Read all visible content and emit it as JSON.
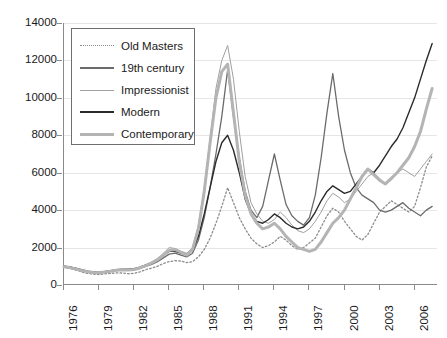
{
  "chart_data": {
    "type": "line",
    "title": "",
    "xlabel": "",
    "ylabel": "",
    "ylim": [
      0,
      14000
    ],
    "xlim": [
      1976,
      2008
    ],
    "grid": true,
    "legend_position": "top-left",
    "ytick_labels": [
      "14000",
      "12000",
      "10000",
      "8000",
      "6000",
      "4000",
      "2000",
      "0"
    ],
    "ytick_values": [
      14000,
      12000,
      10000,
      8000,
      6000,
      4000,
      2000,
      0
    ],
    "xtick_labels": [
      "1976",
      "1979",
      "1982",
      "1985",
      "1988",
      "1991",
      "1994",
      "1997",
      "2000",
      "2003",
      "2006"
    ],
    "xtick_values": [
      1976,
      1979,
      1982,
      1985,
      1988,
      1991,
      1994,
      1997,
      2000,
      2003,
      2006
    ],
    "x": [
      1976,
      1976.5,
      1977,
      1977.5,
      1978,
      1978.5,
      1979,
      1979.5,
      1980,
      1980.5,
      1981,
      1981.5,
      1982,
      1982.5,
      1983,
      1983.5,
      1984,
      1984.5,
      1985,
      1985.5,
      1986,
      1986.5,
      1987,
      1987.5,
      1988,
      1988.5,
      1989,
      1989.5,
      1990,
      1990.5,
      1991,
      1991.5,
      1992,
      1992.5,
      1993,
      1993.5,
      1994,
      1994.5,
      1995,
      1995.5,
      1996,
      1996.5,
      1997,
      1997.5,
      1998,
      1998.5,
      1999,
      1999.5,
      2000,
      2000.5,
      2001,
      2001.5,
      2002,
      2002.5,
      2003,
      2003.5,
      2004,
      2004.5,
      2005,
      2005.5,
      2006,
      2006.5,
      2007,
      2007.5
    ],
    "series": [
      {
        "name": "Old Masters",
        "style": "dotted",
        "color": "#8c8c8c",
        "width": 1.3,
        "values": [
          950,
          880,
          800,
          700,
          620,
          580,
          560,
          600,
          620,
          650,
          640,
          600,
          620,
          700,
          820,
          900,
          1000,
          1150,
          1250,
          1300,
          1280,
          1200,
          1250,
          1500,
          1900,
          2500,
          3300,
          4200,
          5200,
          4400,
          3600,
          3000,
          2500,
          2200,
          2000,
          2100,
          2300,
          2600,
          2400,
          2100,
          1900,
          2000,
          2250,
          2500,
          3100,
          3700,
          4100,
          3900,
          3400,
          3000,
          2600,
          2400,
          2700,
          3300,
          3900,
          4200,
          4500,
          4300,
          4100,
          3900,
          4200,
          5200,
          6300,
          6900
        ]
      },
      {
        "name": "19th century",
        "style": "solid",
        "color": "#6b6b6b",
        "width": 1.3,
        "values": [
          1000,
          950,
          880,
          800,
          720,
          680,
          650,
          700,
          750,
          800,
          820,
          800,
          830,
          900,
          1000,
          1100,
          1250,
          1450,
          1650,
          1700,
          1600,
          1500,
          1700,
          2400,
          3600,
          5200,
          7000,
          9000,
          11500,
          9000,
          6800,
          5000,
          4000,
          3600,
          4200,
          5600,
          7000,
          5600,
          4300,
          3700,
          3400,
          3200,
          3600,
          4800,
          6800,
          9200,
          11300,
          9000,
          7200,
          6000,
          5200,
          4800,
          4600,
          4400,
          4000,
          3900,
          4000,
          4200,
          4400,
          4100,
          3900,
          3700,
          4000,
          4200
        ]
      },
      {
        "name": "Impressionist",
        "style": "solid",
        "color": "#a0a0a0",
        "width": 1.0,
        "values": [
          950,
          900,
          840,
          760,
          700,
          660,
          640,
          680,
          720,
          780,
          800,
          790,
          820,
          900,
          1050,
          1200,
          1400,
          1700,
          2000,
          1950,
          1800,
          1700,
          2000,
          3200,
          5200,
          7800,
          10500,
          12000,
          12800,
          11000,
          8200,
          5800,
          4400,
          3800,
          3400,
          3300,
          3500,
          3900,
          3600,
          3200,
          2900,
          2800,
          3000,
          3400,
          3900,
          4500,
          4900,
          4700,
          4400,
          4600,
          5000,
          5400,
          5800,
          6000,
          5700,
          5400,
          5600,
          6000,
          6200,
          6000,
          5800,
          6200,
          6600,
          7000
        ]
      },
      {
        "name": "Modern",
        "style": "solid",
        "color": "#2b2b2b",
        "width": 1.4,
        "values": [
          1000,
          960,
          900,
          820,
          740,
          700,
          680,
          720,
          770,
          820,
          850,
          840,
          870,
          950,
          1080,
          1200,
          1380,
          1600,
          1800,
          1800,
          1700,
          1650,
          1850,
          2600,
          3800,
          5200,
          6600,
          7600,
          8000,
          7200,
          6000,
          4600,
          3800,
          3400,
          3300,
          3500,
          3800,
          3600,
          3300,
          3100,
          3000,
          3100,
          3400,
          3900,
          4500,
          5000,
          5300,
          5100,
          4900,
          5000,
          5400,
          5800,
          6200,
          6000,
          6400,
          6900,
          7400,
          7800,
          8400,
          9200,
          10000,
          11000,
          12000,
          12900
        ]
      },
      {
        "name": "Contemporary",
        "style": "solid",
        "color": "#b4b4b4",
        "width": 3.0,
        "values": [
          980,
          930,
          860,
          780,
          710,
          670,
          650,
          690,
          740,
          790,
          810,
          800,
          830,
          910,
          1040,
          1180,
          1350,
          1600,
          1850,
          1900,
          1750,
          1600,
          1900,
          3000,
          5000,
          7600,
          10000,
          11400,
          11800,
          9200,
          6600,
          4800,
          3800,
          3300,
          3000,
          3100,
          3300,
          3000,
          2600,
          2300,
          2000,
          1900,
          1800,
          1900,
          2300,
          2800,
          3300,
          3600,
          4000,
          4600,
          5200,
          5800,
          6200,
          5900,
          5600,
          5400,
          5700,
          6000,
          6400,
          6800,
          7400,
          8200,
          9400,
          10500
        ]
      }
    ]
  },
  "legend": {
    "items": [
      {
        "label": "Old Masters"
      },
      {
        "label": "19th century"
      },
      {
        "label": "Impressionist"
      },
      {
        "label": "Modern"
      },
      {
        "label": "Contemporary"
      }
    ]
  }
}
